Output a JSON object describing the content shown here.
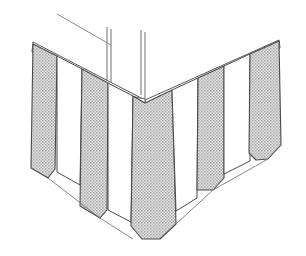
{
  "document": {
    "type": "line-art-technical-illustration",
    "subject": "corner valance / awning skirt with alternating striped panels",
    "background_color": "#ffffff",
    "width": 306,
    "height": 256
  },
  "style": {
    "outline_color": "#4a4a4a",
    "fill_gray": "#c8c8c8",
    "fill_white": "#ffffff",
    "stipple_dot_color": "#9a9a9a",
    "leader_color": "#8a8a8a",
    "post_color": "#6f6f6f"
  },
  "structure": {
    "corner_post": {
      "name": "corner-post",
      "description": "two thin vertical lines forming the upright corner post above the valance",
      "left_edge_x": 107,
      "right_edge_x": 145,
      "top_y": 27,
      "bottom_y": 100
    },
    "apex": {
      "x": 145,
      "y": 100
    },
    "left_top_corner": {
      "x": 33,
      "y": 42
    },
    "right_top_corner": {
      "x": 279,
      "y": 40
    },
    "left_bottom_corner": {
      "x": 32,
      "y": 152
    },
    "right_bottom_corner": {
      "x": 281,
      "y": 148
    },
    "center_bottom": {
      "x": 152,
      "y": 238
    }
  },
  "leader": {
    "name": "leader-line",
    "start": {
      "x": 57,
      "y": 14
    },
    "end": {
      "x": 110,
      "y": 45
    }
  },
  "panels": [
    {
      "id": 1,
      "fill": "gray",
      "side": "left",
      "label": "panel-1-gray"
    },
    {
      "id": 2,
      "fill": "white",
      "side": "left",
      "label": "panel-2-white"
    },
    {
      "id": 3,
      "fill": "gray",
      "side": "left",
      "label": "panel-3-gray"
    },
    {
      "id": 4,
      "fill": "white",
      "side": "left",
      "label": "panel-4-white"
    },
    {
      "id": 5,
      "fill": "gray",
      "side": "center",
      "label": "panel-5-gray-corner"
    },
    {
      "id": 6,
      "fill": "white",
      "side": "right",
      "label": "panel-6-white"
    },
    {
      "id": 7,
      "fill": "gray",
      "side": "right",
      "label": "panel-7-gray"
    },
    {
      "id": 8,
      "fill": "white",
      "side": "right",
      "label": "panel-8-white"
    },
    {
      "id": 9,
      "fill": "gray",
      "side": "right",
      "label": "panel-9-gray"
    }
  ],
  "counts": {
    "total_panels": 9,
    "gray_panels": 5,
    "white_panels": 4
  }
}
